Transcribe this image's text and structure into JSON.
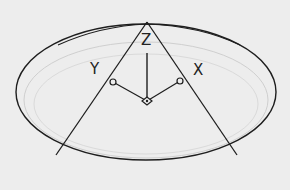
{
  "diagram": {
    "type": "cad-wireframe",
    "colors": {
      "background": "#ededed",
      "stroke": "#1e1e1e",
      "faint": "#c8c8c8"
    },
    "axes": {
      "z_label": "Z",
      "y_label": "Y",
      "x_label": "X"
    },
    "shapes": {
      "base_ellipse": {
        "cx": 146,
        "cy": 92,
        "rx": 130,
        "ry": 68
      },
      "inner_ellipse": {
        "cx": 146,
        "cy": 100,
        "rx": 122,
        "ry": 58
      },
      "apex": {
        "x": 147,
        "y": 22
      },
      "left_generator_end": {
        "x": 56,
        "y": 155
      },
      "right_generator_end": {
        "x": 237,
        "y": 155
      },
      "ucs_origin": {
        "x": 147,
        "y": 101
      },
      "y_axis_end": {
        "x": 113,
        "y": 82
      },
      "x_axis_end": {
        "x": 180,
        "y": 81
      },
      "z_axis_top": {
        "x": 147,
        "y": 53
      }
    }
  }
}
